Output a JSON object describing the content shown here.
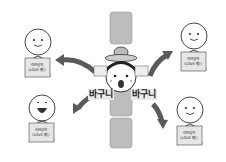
{
  "diagram": {
    "center": {
      "name": "child-with-hat",
      "labels": [
        "바구니",
        "바구니"
      ]
    },
    "people": [
      {
        "position": "top-left",
        "expression": "smile",
        "box_text": [
          "러브상자",
          "(LOVE 箱)"
        ]
      },
      {
        "position": "top-right",
        "expression": "smile",
        "box_text": [
          "러브상자",
          "(LOVE 箱)"
        ]
      },
      {
        "position": "bottom-left",
        "expression": "laugh",
        "box_text": [
          "러브상자",
          "(LOVE 箱)"
        ]
      },
      {
        "position": "bottom-right",
        "expression": "smile",
        "box_text": [
          "러브상자",
          "(LOVE 箱)"
        ]
      }
    ],
    "arrows": [
      "center-to-top-left",
      "center-to-top-right",
      "center-to-bottom-left",
      "center-to-bottom-right"
    ],
    "colors": {
      "pillar": "#b8b8b8",
      "arrow": "#5a5a5a",
      "label_bg": "#eaeaea",
      "line": "#333333"
    }
  }
}
